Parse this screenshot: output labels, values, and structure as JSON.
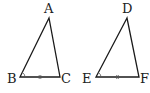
{
  "diagram": {
    "type": "geometry",
    "triangles": [
      {
        "name": "triangle-abc",
        "vertices": {
          "A": {
            "label": "A",
            "x": 49,
            "y": 18
          },
          "B": {
            "label": "B",
            "x": 20,
            "y": 77
          },
          "C": {
            "label": "C",
            "x": 60,
            "y": 77
          }
        },
        "angle_mark_at": "B",
        "equal_side_tick": "BC"
      },
      {
        "name": "triangle-def",
        "vertices": {
          "D": {
            "label": "D",
            "x": 127,
            "y": 18
          },
          "E": {
            "label": "E",
            "x": 96,
            "y": 77
          },
          "F": {
            "label": "F",
            "x": 139,
            "y": 77
          }
        },
        "angle_mark_at": "E",
        "equal_side_tick": "EF"
      }
    ],
    "labels": {
      "A": "A",
      "B": "B",
      "C": "C",
      "D": "D",
      "E": "E",
      "F": "F"
    },
    "colors": {
      "line": "#1a1a1a",
      "text": "#222222",
      "background": "#ffffff"
    }
  }
}
